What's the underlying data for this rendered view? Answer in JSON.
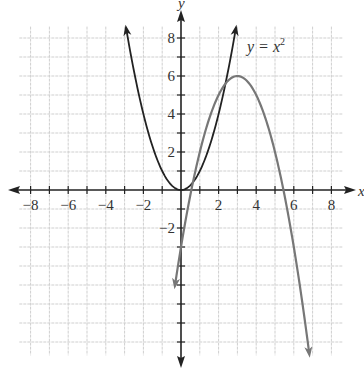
{
  "chart_data": {
    "type": "line",
    "title": "",
    "xlabel": "x",
    "ylabel": "y",
    "xlim": [
      -9,
      9
    ],
    "ylim": [
      -9,
      9
    ],
    "grid": true,
    "x_ticks": [
      -8,
      -6,
      -4,
      -2,
      2,
      4,
      6,
      8
    ],
    "y_ticks": [
      -2,
      2,
      4,
      6,
      8
    ],
    "x_tick_labels": [
      "−8",
      "−6",
      "−4",
      "−2",
      "2",
      "4",
      "6",
      "8"
    ],
    "y_tick_labels": [
      "−2",
      "2",
      "4",
      "6",
      "8"
    ],
    "series": [
      {
        "name": "y = x²",
        "equation": "y = x^2",
        "color": "#222222",
        "x_range": [
          -2.9,
          2.9
        ],
        "points": [
          [
            -2.9,
            8.41
          ],
          [
            -2,
            4
          ],
          [
            -1,
            1
          ],
          [
            0,
            0
          ],
          [
            1,
            1
          ],
          [
            2,
            4
          ],
          [
            2.9,
            8.41
          ]
        ]
      },
      {
        "name": "y = -(x-3)^2 + 6",
        "equation": "y = -(x-3)^2 + 6",
        "color": "#777777",
        "x_range": [
          -0.3,
          6.8
        ],
        "vertex": [
          3,
          6
        ],
        "y_intercept": -3,
        "points": [
          [
            -0.3,
            -4.89
          ],
          [
            0,
            -3
          ],
          [
            1,
            2
          ],
          [
            2,
            5
          ],
          [
            3,
            6
          ],
          [
            4,
            5
          ],
          [
            5,
            2
          ],
          [
            6,
            -3
          ],
          [
            6.8,
            -8.44
          ]
        ]
      }
    ],
    "annotations": [
      {
        "text_prefix": "y = x",
        "superscript": "2",
        "x": 3.5,
        "y": 7.3
      }
    ]
  },
  "labels": {
    "x_axis": "x",
    "y_axis": "y",
    "eq_prefix": "y = x",
    "eq_sup": "2"
  }
}
